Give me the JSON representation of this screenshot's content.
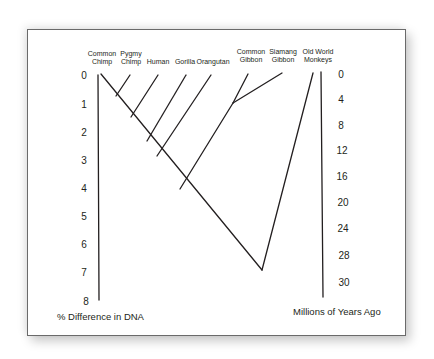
{
  "diagram": {
    "type": "phylogenetic-tree",
    "taxa": [
      {
        "id": "common-chimp",
        "line1": "Common",
        "line2": "Chimp",
        "x": 102
      },
      {
        "id": "pygmy-chimp",
        "line1": "Pygmy",
        "line2": "Chimp",
        "x": 131
      },
      {
        "id": "human",
        "line1": "",
        "line2": "Human",
        "x": 158
      },
      {
        "id": "gorilla",
        "line1": "",
        "line2": "Gorilla",
        "x": 185
      },
      {
        "id": "orangutan",
        "line1": "",
        "line2": "Orangutan",
        "x": 212
      },
      {
        "id": "common-gibbon",
        "line1": "Common",
        "line2": "Gibbon",
        "x": 250
      },
      {
        "id": "siamang-gibbon",
        "line1": "Siamang",
        "line2": "Gibbon",
        "x": 281
      },
      {
        "id": "old-world-monkeys",
        "line1": "Old World",
        "line2": "Monkeys",
        "x": 318
      }
    ],
    "left_axis": {
      "title": "% Difference in DNA",
      "ticks": [
        "0",
        "1",
        "2",
        "3",
        "4",
        "5",
        "6",
        "7",
        "8"
      ]
    },
    "right_axis": {
      "title": "Millions of Years Ago",
      "ticks": [
        "0",
        "4",
        "8",
        "12",
        "16",
        "20",
        "24",
        "28",
        "30"
      ]
    },
    "line_color": "#231f20",
    "text_color": "#231f20"
  }
}
